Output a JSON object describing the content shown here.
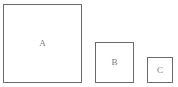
{
  "diagram": {
    "background_color": "#ffffff",
    "stroke_color": "#6a6a6a",
    "label_color": "#7b7b7b",
    "width": 178,
    "height": 87,
    "shapes": [
      {
        "id": "a",
        "label": "A",
        "type": "square",
        "x": 3,
        "y": 4,
        "width": 79,
        "height": 79
      },
      {
        "id": "b",
        "label": "B",
        "type": "square",
        "x": 95,
        "y": 42,
        "width": 39,
        "height": 41
      },
      {
        "id": "c",
        "label": "C",
        "type": "square",
        "x": 147,
        "y": 57,
        "width": 26,
        "height": 26
      }
    ]
  }
}
